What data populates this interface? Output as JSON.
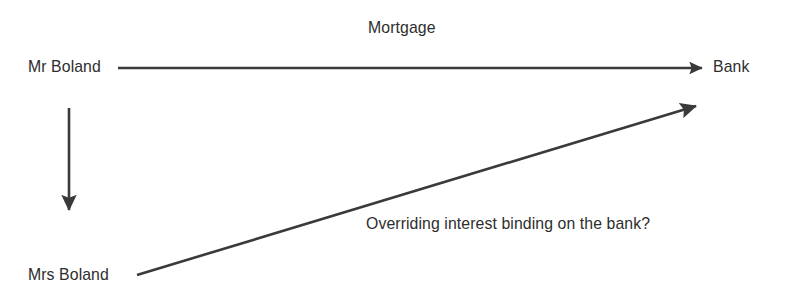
{
  "diagram": {
    "background_color": "#ffffff",
    "stroke_color": "#3a3a3a",
    "text_color": "#2e2e2e",
    "nodes": [
      {
        "id": "mr-boland",
        "label": "Mr Boland",
        "x": 28,
        "y": 58
      },
      {
        "id": "bank",
        "label": "Bank",
        "x": 713,
        "y": 58
      },
      {
        "id": "mrs-boland",
        "label": "Mrs Boland",
        "x": 28,
        "y": 266
      }
    ],
    "edges": [
      {
        "id": "mortgage-edge",
        "label": "Mortgage",
        "from": "mr-boland",
        "to": "bank",
        "direction": "right",
        "x1": 118,
        "y1": 68,
        "x2": 706,
        "y2": 68
      },
      {
        "id": "spouse-edge",
        "label": "",
        "from": "mr-boland",
        "to": "mrs-boland",
        "direction": "down",
        "x1": 69,
        "y1": 108,
        "x2": 69,
        "y2": 216
      },
      {
        "id": "overriding-interest-edge",
        "label": "Overriding interest binding on the bank?",
        "from": "mrs-boland",
        "to": "bank",
        "direction": "up-right",
        "x1": 137,
        "y1": 275,
        "x2": 700,
        "y2": 105
      }
    ],
    "labels": {
      "mortgage": "Mortgage",
      "overriding": "Overriding interest binding on the bank?"
    }
  }
}
